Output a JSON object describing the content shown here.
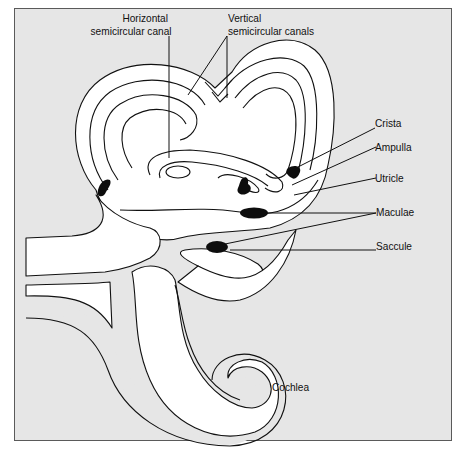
{
  "figure": {
    "colors": {
      "background": "#e6e6e6",
      "frame_border": "#5a5a5a",
      "membrane_fill": "#ffffff",
      "outline": "#111111",
      "sensory_tissue": "#0d0d0d"
    }
  },
  "labels": {
    "horizontal_canal": {
      "line1": "Horizontal",
      "line2": "semicircular canal"
    },
    "vertical_canals": {
      "line1": "Vertical",
      "line2": "semicircular canals"
    },
    "crista": "Crista",
    "ampulla": "Ampulla",
    "utricle": "Utricle",
    "maculae": "Maculae",
    "saccule": "Saccule",
    "cochlea": "Cochlea"
  }
}
